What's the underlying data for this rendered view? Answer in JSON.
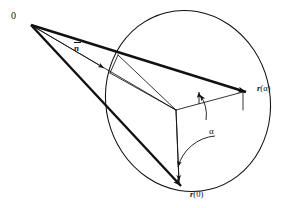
{
  "figure": {
    "kind": "vector-rotation-diagram",
    "background_color": "#ffffff",
    "ink_color": "#111111",
    "labels": {
      "origin": "0",
      "normal_vector_symbol": "n",
      "normal_vector_display": "n̅",
      "position_alpha": "r(α)",
      "position_alpha_vector": "r",
      "position_alpha_arg": "(α)",
      "position_zero": "r(0)",
      "position_zero_vector": "r",
      "position_zero_arg": "(0)",
      "angle": "α"
    },
    "elements": {
      "origin_point": "0",
      "thick_vector_to_r_alpha": "r(α)",
      "thick_vector_to_r_zero": "r(0)",
      "thin_axis_vector": "n̅",
      "rotation_arc": "α",
      "circle_of_rotation": "ellipse",
      "cone_edges": "parallelepiped"
    }
  }
}
